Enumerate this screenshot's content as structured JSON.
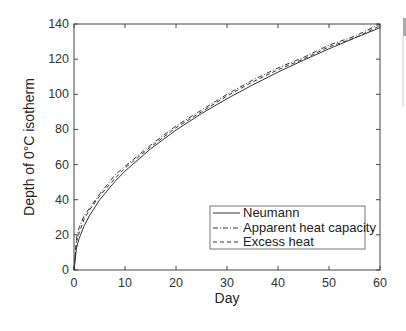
{
  "chart_data": {
    "type": "line",
    "title": "",
    "xlabel": "Day",
    "ylabel": "Depth of 0°C isotherm",
    "xlim": [
      0,
      60
    ],
    "ylim": [
      0,
      140
    ],
    "xticks": [
      0,
      10,
      20,
      30,
      40,
      50,
      60
    ],
    "yticks": [
      0,
      20,
      40,
      60,
      80,
      100,
      120,
      140
    ],
    "grid": false,
    "legend_position": "lower right",
    "x": [
      0,
      0.5,
      1,
      2,
      3,
      5,
      8,
      10,
      15,
      20,
      25,
      30,
      35,
      40,
      45,
      50,
      55,
      60
    ],
    "series": [
      {
        "name": "Neumann",
        "style": "solid",
        "values": [
          0,
          12.6,
          17.8,
          25.2,
          30.8,
          39.8,
          50.3,
          56.3,
          68.9,
          79.6,
          89.0,
          97.5,
          105.3,
          112.6,
          119.4,
          125.9,
          132.0,
          137.9
        ]
      },
      {
        "name": "Apparent heat capacity",
        "style": "dashdot",
        "values": [
          0,
          18,
          24,
          31,
          35,
          43,
          54,
          59,
          71,
          82,
          91,
          100,
          108,
          115,
          121,
          128,
          133,
          140
        ]
      },
      {
        "name": "Excess heat",
        "style": "dashed",
        "values": [
          0,
          16,
          21,
          29,
          34,
          42,
          52,
          58,
          70,
          81,
          90,
          99,
          107,
          114,
          120,
          127,
          132,
          139
        ]
      }
    ]
  },
  "legend": {
    "items": [
      "Neumann",
      "Apparent heat capacity",
      "Excess heat"
    ]
  },
  "axes": {
    "xlabel": "Day",
    "ylabel": "Depth of 0°C isotherm",
    "xtick_labels": [
      "0",
      "10",
      "20",
      "30",
      "40",
      "50",
      "60"
    ],
    "ytick_labels": [
      "0",
      "20",
      "40",
      "60",
      "80",
      "100",
      "120",
      "140"
    ]
  }
}
